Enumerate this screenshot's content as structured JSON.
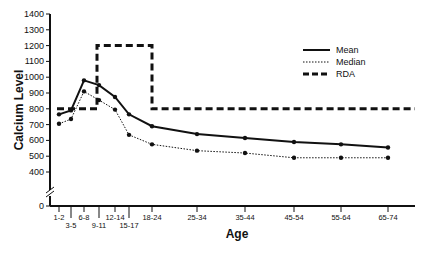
{
  "chart_data": {
    "type": "line",
    "title": "",
    "xlabel": "Age",
    "ylabel": "Calcium Level",
    "ylim": [
      0,
      1400
    ],
    "y_axis_break": [
      0,
      400
    ],
    "yticks": [
      0,
      400,
      500,
      600,
      700,
      800,
      900,
      1000,
      1100,
      1200,
      1300,
      1400
    ],
    "grid": false,
    "legend_position": "upper right",
    "categories": [
      "1-2",
      "3-5",
      "6-8",
      "9-11",
      "12-14",
      "15-17",
      "18-24",
      "25-34",
      "35-44",
      "45-54",
      "55-64",
      "65-74"
    ],
    "series": [
      {
        "name": "Mean",
        "style": "solid",
        "markers": true,
        "values": [
          765,
          790,
          980,
          950,
          875,
          765,
          690,
          640,
          615,
          590,
          575,
          555
        ]
      },
      {
        "name": "Median",
        "style": "dotted",
        "markers": true,
        "values": [
          705,
          735,
          910,
          855,
          795,
          635,
          575,
          535,
          520,
          490,
          490,
          490
        ]
      },
      {
        "name": "RDA",
        "style": "dashed",
        "markers": false,
        "values": [
          800,
          800,
          800,
          1200,
          1200,
          1200,
          800,
          800,
          800,
          800,
          800,
          800
        ]
      }
    ]
  },
  "legend": {
    "items": [
      {
        "label": "Mean",
        "style": "solid"
      },
      {
        "label": "Median",
        "style": "dotted"
      },
      {
        "label": "RDA",
        "style": "dashed"
      }
    ]
  },
  "axes": {
    "x_title": "Age",
    "y_title": "Calcium Level"
  }
}
